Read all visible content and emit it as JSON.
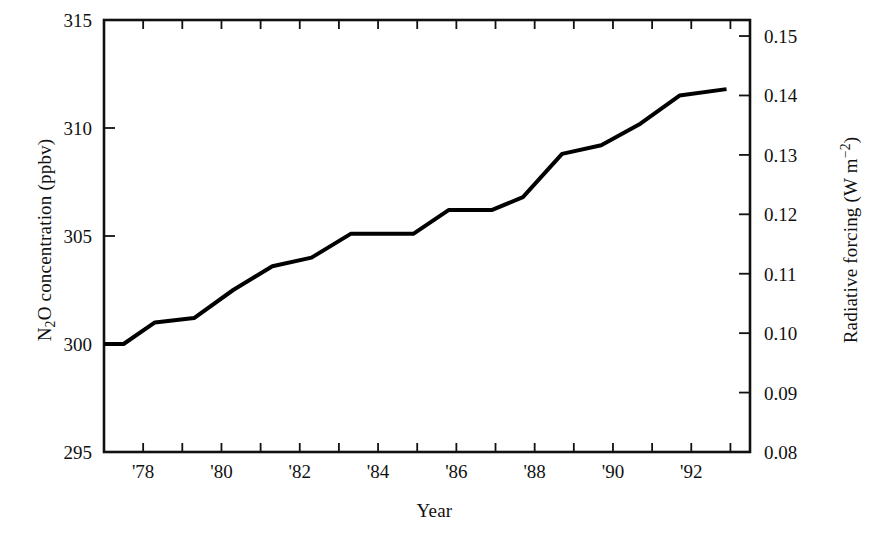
{
  "chart_data": {
    "type": "line",
    "title": "",
    "xlabel": "Year",
    "ylabel": "N2O concentration (ppbv)",
    "ylabel_right": "Radiative forcing (W m-2)",
    "xlim": [
      1977,
      1993.5
    ],
    "ylim": [
      295,
      315
    ],
    "ylim_right": [
      0.08,
      0.1527
    ],
    "grid": false,
    "legend": null,
    "x": [
      1977.0,
      1977.5,
      1978.3,
      1979.3,
      1980.3,
      1981.3,
      1982.3,
      1983.3,
      1984.9,
      1985.8,
      1986.9,
      1987.7,
      1988.7,
      1989.7,
      1990.7,
      1991.7,
      1992.9
    ],
    "values": [
      300.0,
      300.0,
      301.0,
      301.2,
      302.5,
      303.6,
      304.0,
      305.1,
      305.1,
      306.2,
      306.2,
      306.8,
      308.8,
      309.2,
      310.2,
      311.5,
      311.8
    ],
    "series": [
      {
        "name": "N2O concentration",
        "color": "#000000",
        "values": [
          300.0,
          300.0,
          301.0,
          301.2,
          302.5,
          303.6,
          304.0,
          305.1,
          305.1,
          306.2,
          306.2,
          306.8,
          308.8,
          309.2,
          310.2,
          311.5,
          311.8
        ]
      }
    ],
    "yticks_left": [
      295,
      300,
      305,
      310,
      315
    ],
    "ytick_labels_left": [
      "295",
      "300",
      "305",
      "310",
      "315"
    ],
    "yticks_right": [
      0.08,
      0.09,
      0.1,
      0.11,
      0.12,
      0.13,
      0.14,
      0.15
    ],
    "ytick_labels_right": [
      "0.08",
      "0.09",
      "0.10",
      "0.11",
      "0.12",
      "0.13",
      "0.14",
      "0.15"
    ],
    "xticks": [
      1977,
      1978,
      1979,
      1980,
      1981,
      1982,
      1983,
      1984,
      1985,
      1986,
      1987,
      1988,
      1989,
      1990,
      1991,
      1992,
      1993
    ],
    "xtick_labels": [
      "",
      "'78",
      "",
      "'80",
      "",
      "'82",
      "",
      "'84",
      "",
      "'86",
      "",
      "'88",
      "",
      "'90",
      "",
      "'92",
      ""
    ]
  },
  "axes": {
    "left_title_main": "N",
    "left_title_sub": "2",
    "left_title_rest": "O concentration (ppbv)",
    "right_title_main": "Radiative forcing (W m",
    "right_title_sup": "−2",
    "right_title_close": ")",
    "x_title": "Year"
  },
  "style": {
    "line_color": "#000000",
    "axis_color": "#111111",
    "background": "#ffffff",
    "line_width": 4
  }
}
